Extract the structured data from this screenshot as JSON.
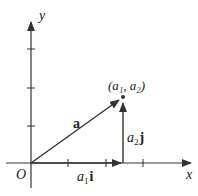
{
  "diagram": {
    "axes": {
      "x_label": "x",
      "y_label": "y",
      "origin_label": "O"
    },
    "vector_a": {
      "label": "a"
    },
    "point": {
      "label": "(a₁, a₂)"
    },
    "component_x": {
      "label_var": "a",
      "label_sub": "1",
      "label_unit": "i"
    },
    "component_y": {
      "label_var": "a",
      "label_sub": "2",
      "label_unit": "j"
    },
    "colors": {
      "stroke": "#333333",
      "text": "#222222"
    }
  }
}
